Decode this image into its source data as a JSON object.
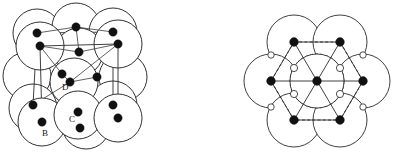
{
  "figure": {
    "title": "",
    "panels": [
      {
        "id": "fcc-unit-cell",
        "name": "face-centred-cubic-unit-cell",
        "description": "Face-centred cubic unit cell drawn in oblique perspective with hard-sphere atoms overlapping",
        "labels": [
          {
            "text": "A",
            "x": 30,
            "y": 108
          },
          {
            "text": "B",
            "x": 42,
            "y": 136
          },
          {
            "text": "C",
            "x": 69,
            "y": 122
          },
          {
            "text": "D",
            "x": 62,
            "y": 90
          }
        ],
        "sphere_radius": 24,
        "spheres": [
          {
            "cx": 37,
            "cy": 33
          },
          {
            "cx": 76,
            "cy": 27
          },
          {
            "cx": 113,
            "cy": 32
          },
          {
            "cx": 40,
            "cy": 46
          },
          {
            "cx": 79,
            "cy": 52
          },
          {
            "cx": 118,
            "cy": 44
          },
          {
            "cx": 27,
            "cy": 76
          },
          {
            "cx": 74,
            "cy": 82
          },
          {
            "cx": 123,
            "cy": 77
          },
          {
            "cx": 33,
            "cy": 108
          },
          {
            "cx": 78,
            "cy": 115
          },
          {
            "cx": 113,
            "cy": 105
          },
          {
            "cx": 42,
            "cy": 122
          },
          {
            "cx": 86,
            "cy": 125
          },
          {
            "cx": 118,
            "cy": 118
          }
        ],
        "atoms": [
          {
            "cx": 37,
            "cy": 33,
            "r": 4.2
          },
          {
            "cx": 113,
            "cy": 32,
            "r": 4.2
          },
          {
            "cx": 40,
            "cy": 46,
            "r": 4.2
          },
          {
            "cx": 118,
            "cy": 44,
            "r": 4.2
          },
          {
            "cx": 76,
            "cy": 27,
            "r": 4.2
          },
          {
            "cx": 79,
            "cy": 52,
            "r": 4.2
          },
          {
            "cx": 62,
            "cy": 74,
            "r": 4.2
          },
          {
            "cx": 70,
            "cy": 82,
            "r": 4.2
          },
          {
            "cx": 97,
            "cy": 77,
            "r": 4.2
          },
          {
            "cx": 33,
            "cy": 105,
            "r": 4.2
          },
          {
            "cx": 113,
            "cy": 105,
            "r": 4.2
          },
          {
            "cx": 42,
            "cy": 122,
            "r": 4.2
          },
          {
            "cx": 118,
            "cy": 118,
            "r": 4.2
          },
          {
            "cx": 78,
            "cy": 112,
            "r": 4.2
          },
          {
            "cx": 80,
            "cy": 128,
            "r": 4.2
          }
        ]
      },
      {
        "id": "close-packed-layer",
        "name": "hexagonal-close-packed-layer",
        "description": "Close-packed plane of seven spheres with dashed hexagon and interstitial voids",
        "sphere_radius": 27,
        "spheres": [
          {
            "cx": 96,
            "cy": 42
          },
          {
            "cx": 142,
            "cy": 42
          },
          {
            "cx": 73,
            "cy": 81
          },
          {
            "cx": 119,
            "cy": 81
          },
          {
            "cx": 165,
            "cy": 81
          },
          {
            "cx": 96,
            "cy": 120
          },
          {
            "cx": 142,
            "cy": 120
          }
        ],
        "atoms": [
          {
            "cx": 96,
            "cy": 42,
            "r": 4.4
          },
          {
            "cx": 142,
            "cy": 42,
            "r": 4.4
          },
          {
            "cx": 73,
            "cy": 81,
            "r": 4.4
          },
          {
            "cx": 119,
            "cy": 81,
            "r": 4.4
          },
          {
            "cx": 165,
            "cy": 81,
            "r": 4.4
          },
          {
            "cx": 96,
            "cy": 120,
            "r": 4.4
          },
          {
            "cx": 142,
            "cy": 120,
            "r": 4.4
          }
        ],
        "voids": [
          {
            "cx": 96,
            "cy": 68,
            "r": 3.6
          },
          {
            "cx": 142,
            "cy": 68,
            "r": 3.6
          },
          {
            "cx": 96,
            "cy": 94,
            "r": 3.6
          },
          {
            "cx": 142,
            "cy": 94,
            "r": 3.6
          },
          {
            "cx": 73,
            "cy": 55,
            "r": 3.2
          },
          {
            "cx": 165,
            "cy": 55,
            "r": 3.2
          },
          {
            "cx": 73,
            "cy": 107,
            "r": 3.2
          },
          {
            "cx": 165,
            "cy": 107,
            "r": 3.2
          }
        ]
      }
    ]
  }
}
